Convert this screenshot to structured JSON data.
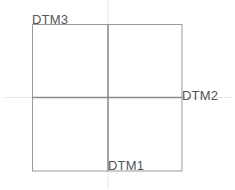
{
  "diagram": {
    "type": "datum-plane-layout",
    "labels": {
      "top_left": "DTM3",
      "right": "DTM2",
      "bottom": "DTM1"
    },
    "colors": {
      "box_stroke": "#9a9a9a",
      "axis_stroke": "#888888",
      "guide_stroke": "#cccccc",
      "label": "#555555",
      "background": "#ffffff"
    }
  }
}
